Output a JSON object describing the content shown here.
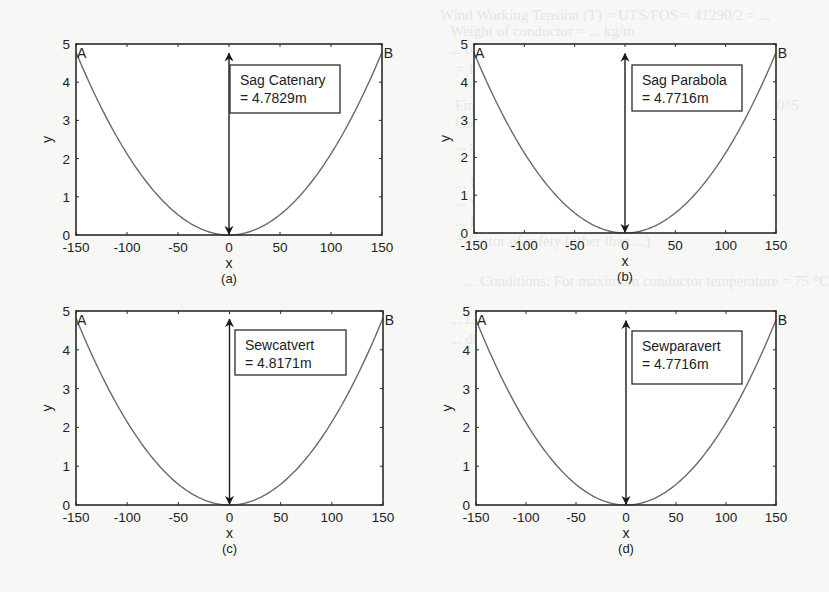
{
  "figure": {
    "panel_layout": "2x2",
    "background_bleed_text": [
      "Wind Working Tension (T) = UTS/FOS = 41290/2 = ...",
      "Weight of conductor = ... kg/m",
      "... of conductor unit area ...",
      "= 1.1... (34.57) ... kg/m",
      "Final value: Young's modulus, spec. of conductor ... 10^5",
      "Coefficient of linear expansion = 1.8 × 10^-5 per °C",
      "... stress f1 = ... = 845.68 kg/cm",
      "... Loading factor 1 ...  wind pressure is ...",
      "... we calculate the working stress ...",
      "... f2 = ... kg/cm",
      "= Factor of safety (other than ...)",
      "... Conditions: For maximum conductor temperature = 75 °C",
      "... Loading factor (q2) = 1 ...",
      "... difference in temperature t = 75 °C − 32.2 ..."
    ]
  },
  "chart_data": [
    {
      "id": "a",
      "type": "line",
      "caption": "(a)",
      "title": "",
      "xlabel": "x",
      "ylabel": "y",
      "xlim": [
        -150,
        150
      ],
      "ylim": [
        0,
        5
      ],
      "xticks": [
        -150,
        -100,
        -50,
        0,
        50,
        100,
        150
      ],
      "yticks": [
        0,
        1,
        2,
        3,
        4,
        5
      ],
      "grid": false,
      "curve": "catenary",
      "sag": 4.7829,
      "endpoints": [
        {
          "label": "A",
          "x": -150,
          "y": 4.7829
        },
        {
          "label": "B",
          "x": 150,
          "y": 4.7829
        }
      ],
      "annotation": {
        "line1": "Sag Catenary",
        "line2": "= 4.7829m",
        "arrow_x": 0,
        "arrow_from_y": 0,
        "arrow_to_y": 4.7829
      },
      "series": [
        {
          "name": "conductor",
          "x": [
            -150,
            -125,
            -100,
            -75,
            -50,
            -25,
            0,
            25,
            50,
            75,
            100,
            125,
            150
          ],
          "y": [
            4.78,
            3.32,
            2.12,
            1.19,
            0.53,
            0.13,
            0,
            0.13,
            0.53,
            1.19,
            2.12,
            3.32,
            4.78
          ]
        }
      ]
    },
    {
      "id": "b",
      "type": "line",
      "caption": "(b)",
      "title": "",
      "xlabel": "x",
      "ylabel": "y",
      "xlim": [
        -150,
        150
      ],
      "ylim": [
        0,
        5
      ],
      "xticks": [
        -150,
        -100,
        -50,
        0,
        50,
        100,
        150
      ],
      "yticks": [
        0,
        1,
        2,
        3,
        4,
        5
      ],
      "grid": false,
      "curve": "parabola",
      "sag": 4.7716,
      "endpoints": [
        {
          "label": "A",
          "x": -150,
          "y": 4.7716
        },
        {
          "label": "B",
          "x": 150,
          "y": 4.7716
        }
      ],
      "annotation": {
        "line1": "Sag Parabola",
        "line2": "= 4.7716m",
        "arrow_x": 0,
        "arrow_from_y": 0,
        "arrow_to_y": 4.7716
      },
      "series": [
        {
          "name": "conductor",
          "x": [
            -150,
            -125,
            -100,
            -75,
            -50,
            -25,
            0,
            25,
            50,
            75,
            100,
            125,
            150
          ],
          "y": [
            4.77,
            3.31,
            2.12,
            1.19,
            0.53,
            0.13,
            0,
            0.13,
            0.53,
            1.19,
            2.12,
            3.31,
            4.77
          ]
        }
      ]
    },
    {
      "id": "c",
      "type": "line",
      "caption": "(c)",
      "title": "",
      "xlabel": "x",
      "ylabel": "y",
      "xlim": [
        -150,
        150
      ],
      "ylim": [
        0,
        5
      ],
      "xticks": [
        -150,
        -100,
        -50,
        0,
        50,
        100,
        150
      ],
      "yticks": [
        0,
        1,
        2,
        3,
        4,
        5
      ],
      "grid": false,
      "curve": "catenary",
      "sag": 4.8171,
      "endpoints": [
        {
          "label": "A",
          "x": -150,
          "y": 4.8171
        },
        {
          "label": "B",
          "x": 150,
          "y": 4.8171
        }
      ],
      "annotation": {
        "line1": "Sewcatvert",
        "line2": "= 4.8171m",
        "arrow_x": 0,
        "arrow_from_y": 0,
        "arrow_to_y": 4.8171
      },
      "series": [
        {
          "name": "conductor",
          "x": [
            -150,
            -125,
            -100,
            -75,
            -50,
            -25,
            0,
            25,
            50,
            75,
            100,
            125,
            150
          ],
          "y": [
            4.82,
            3.34,
            2.14,
            1.2,
            0.53,
            0.13,
            0,
            0.13,
            0.53,
            1.2,
            2.14,
            3.34,
            4.82
          ]
        }
      ]
    },
    {
      "id": "d",
      "type": "line",
      "caption": "(d)",
      "title": "",
      "xlabel": "x",
      "ylabel": "y",
      "xlim": [
        -150,
        150
      ],
      "ylim": [
        0,
        5
      ],
      "xticks": [
        -150,
        -100,
        -50,
        0,
        50,
        100,
        150
      ],
      "yticks": [
        0,
        1,
        2,
        3,
        4,
        5
      ],
      "grid": false,
      "curve": "parabola",
      "sag": 4.7716,
      "endpoints": [
        {
          "label": "A",
          "x": -150,
          "y": 4.7716
        },
        {
          "label": "B",
          "x": 150,
          "y": 4.7716
        }
      ],
      "annotation": {
        "line1": "Sewparavert",
        "line2": "= 4.7716m",
        "arrow_x": 0,
        "arrow_from_y": 0,
        "arrow_to_y": 4.7716
      },
      "series": [
        {
          "name": "conductor",
          "x": [
            -150,
            -125,
            -100,
            -75,
            -50,
            -25,
            0,
            25,
            50,
            75,
            100,
            125,
            150
          ],
          "y": [
            4.77,
            3.31,
            2.12,
            1.19,
            0.53,
            0.13,
            0,
            0.13,
            0.53,
            1.19,
            2.12,
            3.31,
            4.77
          ]
        }
      ]
    }
  ],
  "layout": {
    "panels": [
      {
        "left": 76,
        "top": 44,
        "right": 382,
        "bottom": 235,
        "box": {
          "x": 230,
          "y": 65,
          "w": 110,
          "h": 48
        }
      },
      {
        "left": 474,
        "top": 44,
        "right": 776,
        "bottom": 233,
        "box": {
          "x": 632,
          "y": 65,
          "w": 110,
          "h": 46
        }
      },
      {
        "left": 76,
        "top": 311,
        "right": 383,
        "bottom": 505,
        "box": {
          "x": 235,
          "y": 330,
          "w": 111,
          "h": 45
        }
      },
      {
        "left": 476,
        "top": 311,
        "right": 776,
        "bottom": 505,
        "box": {
          "x": 632,
          "y": 331,
          "w": 110,
          "h": 53
        }
      }
    ],
    "colors": {
      "axes": "#2b2b2b",
      "curve": "#6a6a6a",
      "arrow": "#1a1a1a",
      "box_border": "#2b2b2b",
      "box_fill": "#ffffff"
    }
  }
}
